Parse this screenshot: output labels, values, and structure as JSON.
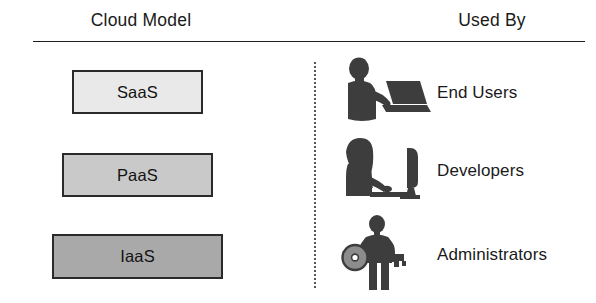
{
  "diagram": {
    "title_left": "Cloud Model",
    "title_right": "Used By",
    "colors": {
      "saas_fill": "#e9e9e9",
      "paas_fill": "#c9c9c9",
      "iaas_fill": "#a9a9a9",
      "border": "#2a2a2a",
      "text": "#1a1a1a",
      "icon": "#3d3d3d",
      "divider": "#1d1d1d",
      "dotted_divider": "#555555"
    },
    "cloud_models": [
      {
        "label": "SaaS",
        "fill": "#e9e9e9"
      },
      {
        "label": "PaaS",
        "fill": "#c9c9c9"
      },
      {
        "label": "IaaS",
        "fill": "#a9a9a9"
      }
    ],
    "used_by": [
      {
        "label": "End Users",
        "icon": "person-with-laptop-icon"
      },
      {
        "label": "Developers",
        "icon": "person-at-desktop-computer-icon"
      },
      {
        "label": "Administrators",
        "icon": "person-holding-key-icon"
      }
    ]
  }
}
